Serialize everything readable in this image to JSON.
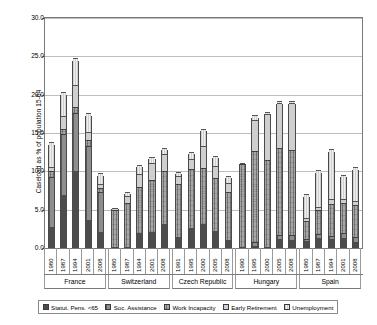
{
  "chart_data": {
    "type": "bar",
    "stacked": true,
    "title": "",
    "xlabel": "",
    "ylabel": "Caseload as % of population 15-64",
    "ylim": [
      0,
      30
    ],
    "ytick_labels": [
      "0.0",
      "5.0",
      "10.0",
      "15.0",
      "20.0",
      "25.0",
      "30.0"
    ],
    "ytick_values": [
      0,
      5,
      10,
      15,
      20,
      25,
      30
    ],
    "grid": true,
    "legend_position": "bottom",
    "series": [
      {
        "name": "Statut. Pens. <65",
        "key": "statutory_pensions_under65"
      },
      {
        "name": "Soc. Assistance",
        "key": "social_assistance"
      },
      {
        "name": "Work Incapacity",
        "key": "work_incapacity"
      },
      {
        "name": "Early Retirement",
        "key": "early_retirement"
      },
      {
        "name": "Unemployment",
        "key": "unemployment"
      }
    ],
    "groups": [
      {
        "name": "France",
        "categories": [
          "1980",
          "1987",
          "1994",
          "2001",
          "2008"
        ],
        "stacks": [
          {
            "category": "1980",
            "values": [
              2.6,
              6.6,
              0.6,
              0.5,
              3.2
            ],
            "total": 13.5
          },
          {
            "category": "1987",
            "values": [
              6.9,
              7.9,
              0.5,
              1.6,
              3.0
            ],
            "total": 19.9
          },
          {
            "category": "1994",
            "values": [
              10.0,
              7.6,
              0.6,
              2.8,
              3.4
            ],
            "total": 24.4
          },
          {
            "category": "2001",
            "values": [
              3.6,
              9.7,
              0.6,
              1.0,
              2.3
            ],
            "total": 17.2
          },
          {
            "category": "2008",
            "values": [
              2.0,
              5.2,
              0.4,
              0.4,
              1.4
            ],
            "total": 9.4
          }
        ]
      },
      {
        "name": "Switzerland",
        "categories": [
          "1980",
          "1987",
          "1994",
          "2001",
          "2008"
        ],
        "stacks": [
          {
            "category": "1980",
            "values": [
              0.0,
              0.0,
              4.9,
              0.2,
              0.0
            ],
            "total": 5.1
          },
          {
            "category": "1987",
            "values": [
              0.0,
              0.0,
              5.8,
              0.9,
              0.4
            ],
            "total": 7.1
          },
          {
            "category": "1994",
            "values": [
              1.9,
              0.0,
              6.0,
              1.6,
              1.1
            ],
            "total": 10.6
          },
          {
            "category": "2001",
            "values": [
              2.0,
              0.0,
              6.8,
              2.1,
              0.7
            ],
            "total": 11.6
          },
          {
            "category": "2008",
            "values": [
              3.1,
              0.0,
              6.9,
              2.1,
              0.7
            ],
            "total": 12.8
          }
        ]
      },
      {
        "name": "Czech Republic",
        "categories": [
          "1991",
          "1995",
          "2000",
          "2005",
          "2008"
        ],
        "stacks": [
          {
            "category": "1991",
            "values": [
              1.3,
              0.0,
              7.0,
              1.0,
              0.4
            ],
            "total": 9.7
          },
          {
            "category": "1995",
            "values": [
              2.6,
              0.0,
              7.7,
              1.1,
              0.9
            ],
            "total": 12.3
          },
          {
            "category": "2000",
            "values": [
              3.0,
              0.0,
              7.3,
              2.8,
              2.2
            ],
            "total": 15.3
          },
          {
            "category": "2005",
            "values": [
              2.2,
              0.0,
              6.9,
              1.5,
              1.2
            ],
            "total": 11.8
          },
          {
            "category": "2008",
            "values": [
              0.9,
              0.0,
              6.4,
              1.0,
              0.8
            ],
            "total": 9.1
          }
        ]
      },
      {
        "name": "Hungary",
        "categories": [
          "1990",
          "1995",
          "2000",
          "2005",
          "2008"
        ],
        "stacks": [
          {
            "category": "1990",
            "values": [
              0.0,
              0.0,
              10.9,
              0.1,
              0.0
            ],
            "total": 11.0
          },
          {
            "category": "1995",
            "values": [
              0.2,
              0.3,
              11.9,
              4.0,
              0.5
            ],
            "total": 16.9
          },
          {
            "category": "2000",
            "values": [
              0.0,
              0.0,
              11.4,
              5.9,
              0.2
            ],
            "total": 17.5
          },
          {
            "category": "2005",
            "values": [
              1.0,
              0.5,
              11.4,
              5.7,
              0.2
            ],
            "total": 18.8
          },
          {
            "category": "2008",
            "values": [
              0.9,
              0.5,
              11.2,
              6.0,
              0.2
            ],
            "total": 18.8
          }
        ]
      },
      {
        "name": "Spain",
        "categories": [
          "1980",
          "1987",
          "1994",
          "2001",
          "2008"
        ],
        "stacks": [
          {
            "category": "1980",
            "values": [
              0.8,
              0.2,
              2.2,
              0.3,
              3.2
            ],
            "total": 6.7
          },
          {
            "category": "1987",
            "values": [
              1.2,
              0.4,
              3.1,
              0.3,
              4.8
            ],
            "total": 9.8
          },
          {
            "category": "1994",
            "values": [
              1.1,
              0.3,
              4.1,
              0.5,
              6.5
            ],
            "total": 12.5
          },
          {
            "category": "2001",
            "values": [
              1.2,
              0.5,
              3.9,
              0.4,
              3.2
            ],
            "total": 9.2
          },
          {
            "category": "2008",
            "values": [
              0.7,
              0.5,
              4.2,
              0.4,
              4.4
            ],
            "total": 10.2
          }
        ]
      }
    ]
  },
  "legend": {
    "items": [
      {
        "label": "Statut. Pens. <65",
        "swatch": "legend-swatch-statut-pens"
      },
      {
        "label": "Soc. Assistance",
        "swatch": "legend-swatch-soc-assistance"
      },
      {
        "label": "Work Incapacity",
        "swatch": "legend-swatch-work-incapacity"
      },
      {
        "label": "Early Retirement",
        "swatch": "legend-swatch-early-retirement"
      },
      {
        "label": "Unemployment",
        "swatch": "legend-swatch-unemployment"
      }
    ]
  },
  "colors": {
    "statutory_pensions_under65": "#4c4c4c",
    "social_assistance": "#8e8e8e",
    "work_incapacity": "#a6a6a6",
    "early_retirement": "#cfcfcf",
    "unemployment": "#efefef",
    "gridline": "#bdbdbd",
    "axis": "#7a7a7a",
    "text": "#000000",
    "background": "#ffffff"
  }
}
